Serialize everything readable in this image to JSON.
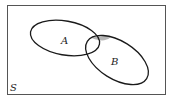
{
  "diagram": {
    "type": "venn",
    "universe_label": "S",
    "sets": [
      {
        "id": "A",
        "label": "A"
      },
      {
        "id": "B",
        "label": "B"
      }
    ],
    "shaded_region": "A ∩ B",
    "colors": {
      "stroke": "#1a1a1a",
      "frame": "#555555",
      "shade": "#b5b5b5",
      "background": "#ffffff"
    }
  }
}
